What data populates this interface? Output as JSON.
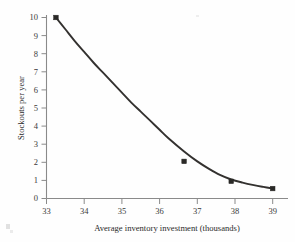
{
  "chart_data": {
    "type": "line",
    "title": "",
    "xlabel": "Average inventory investment (thousands)",
    "ylabel": "Stockouts per year",
    "xlim": [
      33,
      39.4
    ],
    "ylim": [
      0,
      10.4
    ],
    "xticks": [
      "33",
      "34",
      "35",
      "36",
      "37",
      "38",
      "39"
    ],
    "xtick_values": [
      33,
      34,
      35,
      36,
      37,
      38,
      39
    ],
    "yticks": [
      "0",
      "1",
      "2",
      "3",
      "4",
      "5",
      "6",
      "7",
      "8",
      "9",
      "10"
    ],
    "ytick_values": [
      0,
      1,
      2,
      3,
      4,
      5,
      6,
      7,
      8,
      9,
      10
    ],
    "grid": false,
    "legend": false,
    "series": [
      {
        "name": "Stockouts vs investment",
        "x": [
          33.25,
          36.65,
          37.9,
          39.0
        ],
        "values": [
          10.0,
          2.05,
          0.95,
          0.55
        ],
        "marker": "square",
        "color": "#33312f",
        "curve_x": [
          33.25,
          33.5,
          33.75,
          34.0,
          34.25,
          34.5,
          34.75,
          35.0,
          35.25,
          35.5,
          35.75,
          36.0,
          36.25,
          36.65,
          37.0,
          37.3,
          37.6,
          37.9,
          38.2,
          38.5,
          38.75,
          39.0
        ],
        "curve_y": [
          10.0,
          9.35,
          8.7,
          8.1,
          7.5,
          6.95,
          6.4,
          5.85,
          5.3,
          4.8,
          4.3,
          3.8,
          3.3,
          2.6,
          2.05,
          1.65,
          1.3,
          1.05,
          0.88,
          0.74,
          0.64,
          0.55
        ]
      }
    ],
    "annotations": [],
    "colors": {
      "curve": "#33312f",
      "axis": "#8a8a8a",
      "text": "#2b2b2b",
      "background": "#fefefe"
    }
  }
}
